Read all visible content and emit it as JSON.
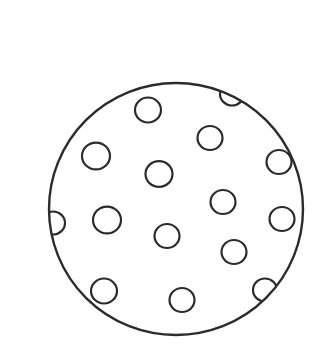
{
  "drawing": {
    "stroke_color": "#2b2b2b",
    "background": "#ffffff",
    "outer_circle": {
      "cx": 176,
      "cy": 209,
      "rx": 127,
      "ry": 126,
      "stroke_width": 2.4
    },
    "dots": [
      {
        "cx": 148,
        "cy": 110,
        "r": 13
      },
      {
        "cx": 232,
        "cy": 94,
        "r": 12
      },
      {
        "cx": 210,
        "cy": 138,
        "r": 12.5
      },
      {
        "cx": 96,
        "cy": 156,
        "r": 14
      },
      {
        "cx": 159,
        "cy": 174,
        "r": 13.5
      },
      {
        "cx": 279,
        "cy": 162,
        "r": 12.5
      },
      {
        "cx": 223,
        "cy": 202,
        "r": 12.5
      },
      {
        "cx": 107,
        "cy": 220,
        "r": 14
      },
      {
        "cx": 282,
        "cy": 219,
        "r": 12.5
      },
      {
        "cx": 53,
        "cy": 223,
        "r": 12
      },
      {
        "cx": 167,
        "cy": 236,
        "r": 12.5
      },
      {
        "cx": 234,
        "cy": 252,
        "r": 12.5
      },
      {
        "cx": 104,
        "cy": 291,
        "r": 13
      },
      {
        "cx": 182,
        "cy": 300,
        "r": 12.5
      },
      {
        "cx": 265,
        "cy": 290,
        "r": 12
      }
    ]
  }
}
